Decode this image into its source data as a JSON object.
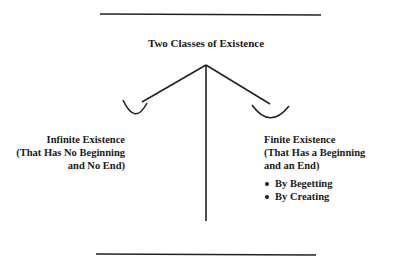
{
  "diagram": {
    "title": "Two Classes of Existence",
    "branches": [
      {
        "name": "infinite",
        "lines": [
          "Infinite Existence",
          "(That Has No Beginning",
          "and No End)"
        ],
        "bullets": []
      },
      {
        "name": "finite",
        "lines": [
          "Finite Existence",
          "(That Has a Beginning",
          "and an End)"
        ],
        "bullets": [
          "By Begetting",
          "By Creating"
        ]
      }
    ]
  },
  "colors": {
    "ink": "#1a1a1a",
    "background": "#ffffff"
  }
}
